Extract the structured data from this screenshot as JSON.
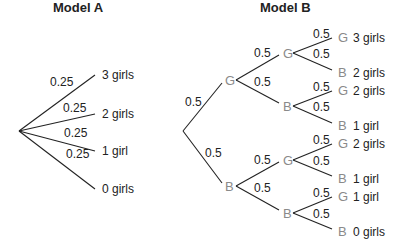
{
  "model_a": {
    "title": "Model A",
    "branches": [
      {
        "prob": "0.25",
        "outcome": "3 girls"
      },
      {
        "prob": "0.25",
        "outcome": "2 girls"
      },
      {
        "prob": "0.25",
        "outcome": "1 girl"
      },
      {
        "prob": "0.25",
        "outcome": "0 girls"
      }
    ]
  },
  "model_b": {
    "title": "Model B",
    "level1": [
      {
        "node": "G",
        "prob": "0.5"
      },
      {
        "node": "B",
        "prob": "0.5"
      }
    ],
    "level2": [
      {
        "node": "G",
        "prob": "0.5"
      },
      {
        "node": "B",
        "prob": "0.5"
      },
      {
        "node": "G",
        "prob": "0.5"
      },
      {
        "node": "B",
        "prob": "0.5"
      }
    ],
    "leaves": [
      {
        "node": "G",
        "prob": "0.5",
        "outcome": "3 girls"
      },
      {
        "node": "B",
        "prob": "0.5",
        "outcome": "2 girls"
      },
      {
        "node": "G",
        "prob": "0.5",
        "outcome": "2 girls"
      },
      {
        "node": "B",
        "prob": "0.5",
        "outcome": "1 girl"
      },
      {
        "node": "G",
        "prob": "0.5",
        "outcome": "2 girls"
      },
      {
        "node": "B",
        "prob": "0.5",
        "outcome": "1 girl"
      },
      {
        "node": "G",
        "prob": "0.5",
        "outcome": "1 girl"
      },
      {
        "node": "B",
        "prob": "0.5",
        "outcome": "0 girls"
      }
    ]
  }
}
